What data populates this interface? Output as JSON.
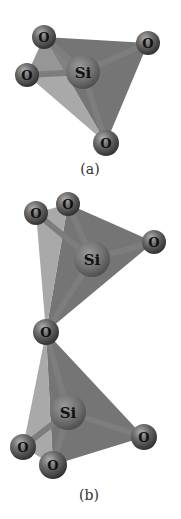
{
  "figure": {
    "panels": [
      {
        "id": "a",
        "caption": "(a)",
        "description": "SiO4 tetrahedron",
        "center": {
          "label": "Si",
          "x": 83,
          "y": 72,
          "r": 17
        },
        "atoms": [
          {
            "label": "O",
            "x": 44,
            "y": 37,
            "r": 12
          },
          {
            "label": "O",
            "x": 148,
            "y": 43,
            "r": 12
          },
          {
            "label": "O",
            "x": 27,
            "y": 75,
            "r": 12
          },
          {
            "label": "O",
            "x": 106,
            "y": 143,
            "r": 13
          }
        ]
      },
      {
        "id": "b",
        "caption": "(b)",
        "description": "Two corner-sharing SiO4 tetrahedra linked by a bridging oxygen",
        "upper": {
          "center": {
            "label": "Si",
            "x": 92,
            "y": 259,
            "r": 18
          },
          "atoms": [
            {
              "label": "O",
              "x": 36,
              "y": 213,
              "r": 12
            },
            {
              "label": "O",
              "x": 68,
              "y": 204,
              "r": 12
            },
            {
              "label": "O",
              "x": 154,
              "y": 242,
              "r": 12
            }
          ]
        },
        "bridging": {
          "label": "O",
          "x": 46,
          "y": 332,
          "r": 13
        },
        "lower": {
          "center": {
            "label": "Si",
            "x": 68,
            "y": 412,
            "r": 18
          },
          "atoms": [
            {
              "label": "O",
              "x": 23,
              "y": 447,
              "r": 13
            },
            {
              "label": "O",
              "x": 53,
              "y": 465,
              "r": 14
            },
            {
              "label": "O",
              "x": 144,
              "y": 437,
              "r": 13
            }
          ]
        }
      }
    ],
    "colors": {
      "face_dark": "#6e6e6e",
      "face_light": "#9a9a9a",
      "bond": "#7d7d7d",
      "atom_fill": "#5a5a5a",
      "atom_highlight": "#a0a0a0",
      "si_fill": "#777777",
      "label": "#111111",
      "background": "#ffffff"
    }
  }
}
